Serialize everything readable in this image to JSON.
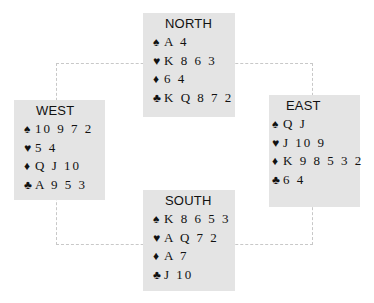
{
  "suits": {
    "spades": "♠",
    "hearts": "♥",
    "diamonds": "♦",
    "clubs": "♣"
  },
  "hands": {
    "north": {
      "label": "NORTH",
      "spades": "A 4",
      "hearts": "K 8 6 3",
      "diamonds": "6 4",
      "clubs": "K Q 8 7 2"
    },
    "west": {
      "label": "WEST",
      "spades": "10 9 7 2",
      "hearts": "5 4",
      "diamonds": "Q J 10",
      "clubs": "A 9 5 3"
    },
    "east": {
      "label": "EAST",
      "spades": "Q J",
      "hearts": "J 10 9",
      "diamonds": "K 9 8 5 3 2",
      "clubs": "6 4"
    },
    "south": {
      "label": "SOUTH",
      "spades": "K 8 6 5 3",
      "hearts": "A Q 7 2",
      "diamonds": "A 7",
      "clubs": "J 10"
    }
  },
  "colors": {
    "box_background": "#e4e4e4",
    "connector": "#c8c8c8",
    "text": "#111111"
  }
}
